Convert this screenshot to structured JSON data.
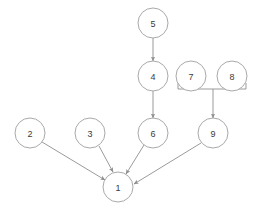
{
  "diagram": {
    "canvas": {
      "width": 264,
      "height": 214,
      "background": "#ffffff"
    },
    "style": {
      "node_stroke": "#a9a9a9",
      "node_fill": "#ffffff",
      "label_color": "#3a3a3a",
      "edge_color": "#8f8f8f",
      "node_radius": 15
    },
    "nodes": [
      {
        "id": "1",
        "label": "1",
        "cx": 118,
        "cy": 187,
        "r": 15
      },
      {
        "id": "2",
        "label": "2",
        "cx": 30,
        "cy": 133,
        "r": 15
      },
      {
        "id": "3",
        "label": "3",
        "cx": 90,
        "cy": 133,
        "r": 15
      },
      {
        "id": "4",
        "label": "4",
        "cx": 153,
        "cy": 76,
        "r": 15
      },
      {
        "id": "5",
        "label": "5",
        "cx": 153,
        "cy": 23,
        "r": 15
      },
      {
        "id": "6",
        "label": "6",
        "cx": 153,
        "cy": 133,
        "r": 15
      },
      {
        "id": "7",
        "label": "7",
        "cx": 191,
        "cy": 76,
        "r": 15
      },
      {
        "id": "8",
        "label": "8",
        "cx": 232,
        "cy": 76,
        "r": 15
      },
      {
        "id": "9",
        "label": "9",
        "cx": 213,
        "cy": 133,
        "r": 15
      }
    ],
    "edges": [
      {
        "from": "5",
        "to": "4",
        "x1": 153,
        "y1": 38,
        "x2": 153,
        "y2": 61,
        "arrow": true
      },
      {
        "from": "4",
        "to": "6",
        "x1": 153,
        "y1": 91,
        "x2": 153,
        "y2": 118,
        "arrow": true
      },
      {
        "from": "bracket",
        "to": "9",
        "x1": 213,
        "y1": 89,
        "x2": 213,
        "y2": 118,
        "arrow": true
      },
      {
        "from": "2",
        "to": "1",
        "x1": 42,
        "y1": 142,
        "x2": 105,
        "y2": 180,
        "arrow": true
      },
      {
        "from": "3",
        "to": "1",
        "x1": 99,
        "y1": 146,
        "x2": 113,
        "y2": 172,
        "arrow": true
      },
      {
        "from": "6",
        "to": "1",
        "x1": 144,
        "y1": 145,
        "x2": 126,
        "y2": 174,
        "arrow": true
      },
      {
        "from": "9",
        "to": "1",
        "x1": 201,
        "y1": 143,
        "x2": 134,
        "y2": 184,
        "arrow": true
      }
    ],
    "bracket": {
      "label": "group-bracket-7-8",
      "left_x": 178,
      "right_x": 246,
      "y": 89,
      "tick_height": 6,
      "members": [
        "7",
        "8"
      ],
      "joins_to": "9"
    }
  }
}
